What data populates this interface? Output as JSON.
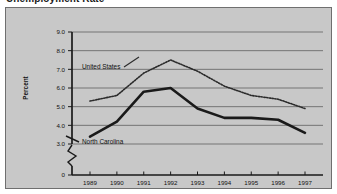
{
  "figure": {
    "title": "Unemployment Rate",
    "background_color": "#c8c8c8",
    "page_background": "#ffffff",
    "border_color": "#6f6f6f"
  },
  "axes": {
    "y_axis_title": "Percent",
    "y_tick_labels": [
      "9.0",
      "8.0",
      "7.0",
      "6.0",
      "5.0",
      "4.0",
      "3.0",
      "0"
    ],
    "y_axis_break": true,
    "x_tick_labels": [
      "1989",
      "1990",
      "1991",
      "1992",
      "1993",
      "1994",
      "1995",
      "1996",
      "1997"
    ],
    "axis_color": "#1a1a1a",
    "gridline_color": "#6b6b6b"
  },
  "annotations": {
    "united_states_label": "United States",
    "north_carolina_label": "North Carolina"
  },
  "chart_data": {
    "type": "line",
    "title": "Unemployment Rate",
    "xlabel": "",
    "ylabel": "Percent",
    "x": [
      1989,
      1990,
      1991,
      1992,
      1993,
      1994,
      1995,
      1996,
      1997
    ],
    "categories": [
      "1989",
      "1990",
      "1991",
      "1992",
      "1993",
      "1994",
      "1995",
      "1996",
      "1997"
    ],
    "ylim": [
      3.0,
      9.0
    ],
    "y_ticks": [
      3.0,
      4.0,
      5.0,
      6.0,
      7.0,
      8.0,
      9.0
    ],
    "y_axis_broken_to_zero": true,
    "grid": true,
    "grid_axis": "y",
    "legend": "inline-annotations",
    "series": [
      {
        "name": "United States",
        "style": "dotted",
        "color": "#2b2b2b",
        "line_width": 1.6,
        "values": [
          5.3,
          5.6,
          6.8,
          7.5,
          6.9,
          6.1,
          5.6,
          5.4,
          4.9
        ]
      },
      {
        "name": "North Carolina",
        "style": "solid",
        "color": "#1a1a1a",
        "line_width": 2.6,
        "values": [
          3.4,
          4.2,
          5.8,
          6.0,
          4.9,
          4.4,
          4.4,
          4.3,
          3.6
        ]
      }
    ]
  }
}
